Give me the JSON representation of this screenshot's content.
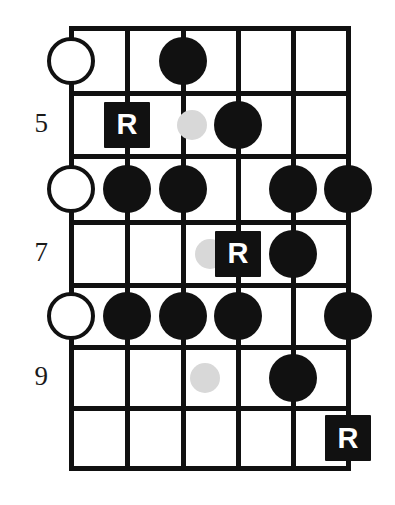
{
  "diagram": {
    "type": "guitar-fretboard-scale-diagram",
    "orientation": "vertical",
    "strings_count": 6,
    "frets_count": 7,
    "colors": {
      "line": "#111111",
      "filled_note": "#111111",
      "ghost_note": "#d8d8d8",
      "open_note_fill": "#ffffff",
      "root_box": "#111111",
      "root_label_color": "#ffffff",
      "background": "#ffffff"
    },
    "fret_numbers": [
      {
        "label": "5",
        "row": 2
      },
      {
        "label": "7",
        "row": 4
      },
      {
        "label": "9",
        "row": 6
      }
    ],
    "root_label": "R",
    "markers": [
      {
        "kind": "open",
        "row": 1,
        "string": 1
      },
      {
        "kind": "filled",
        "row": 1,
        "string": 3
      },
      {
        "kind": "root",
        "row": 2,
        "string": 2
      },
      {
        "kind": "ghost",
        "row": 2,
        "string": 3,
        "offset_x": 9
      },
      {
        "kind": "filled",
        "row": 2,
        "string": 4
      },
      {
        "kind": "open",
        "row": 3,
        "string": 1
      },
      {
        "kind": "filled",
        "row": 3,
        "string": 2
      },
      {
        "kind": "filled",
        "row": 3,
        "string": 3
      },
      {
        "kind": "filled",
        "row": 3,
        "string": 5
      },
      {
        "kind": "filled",
        "row": 3,
        "string": 6
      },
      {
        "kind": "ghost",
        "row": 4,
        "string": 4,
        "offset_x": -28
      },
      {
        "kind": "root",
        "row": 4,
        "string": 4
      },
      {
        "kind": "filled",
        "row": 4,
        "string": 5
      },
      {
        "kind": "open",
        "row": 5,
        "string": 1
      },
      {
        "kind": "filled",
        "row": 5,
        "string": 2
      },
      {
        "kind": "filled",
        "row": 5,
        "string": 3
      },
      {
        "kind": "filled",
        "row": 5,
        "string": 4
      },
      {
        "kind": "filled",
        "row": 5,
        "string": 6
      },
      {
        "kind": "ghost",
        "row": 6,
        "string": 3,
        "offset_x": 22
      },
      {
        "kind": "filled",
        "row": 6,
        "string": 5
      },
      {
        "kind": "root",
        "row": 7,
        "string": 6
      }
    ]
  },
  "geometry": {
    "string_x": [
      71,
      127,
      183,
      238,
      293,
      348
    ],
    "fret_y": [
      28,
      93,
      156,
      222,
      285,
      347,
      408,
      468
    ],
    "open_radius": 24,
    "filled_radius": 24,
    "ghost_radius": 15,
    "root_size": 46,
    "fret_number_x": 14,
    "line_thickness": 5
  }
}
